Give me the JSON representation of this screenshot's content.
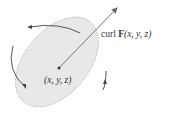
{
  "diagram": {
    "vector_label_prefix": "curl ",
    "vector_label_bold": "F",
    "vector_label_args": "(x, y, z)",
    "point_label": "(x, y, z)",
    "colors": {
      "surface_fill": "#e8e8e8",
      "curve_solid": "#555555",
      "curve_dotted": "#888888",
      "vector": "#777777",
      "text": "#333333"
    }
  }
}
